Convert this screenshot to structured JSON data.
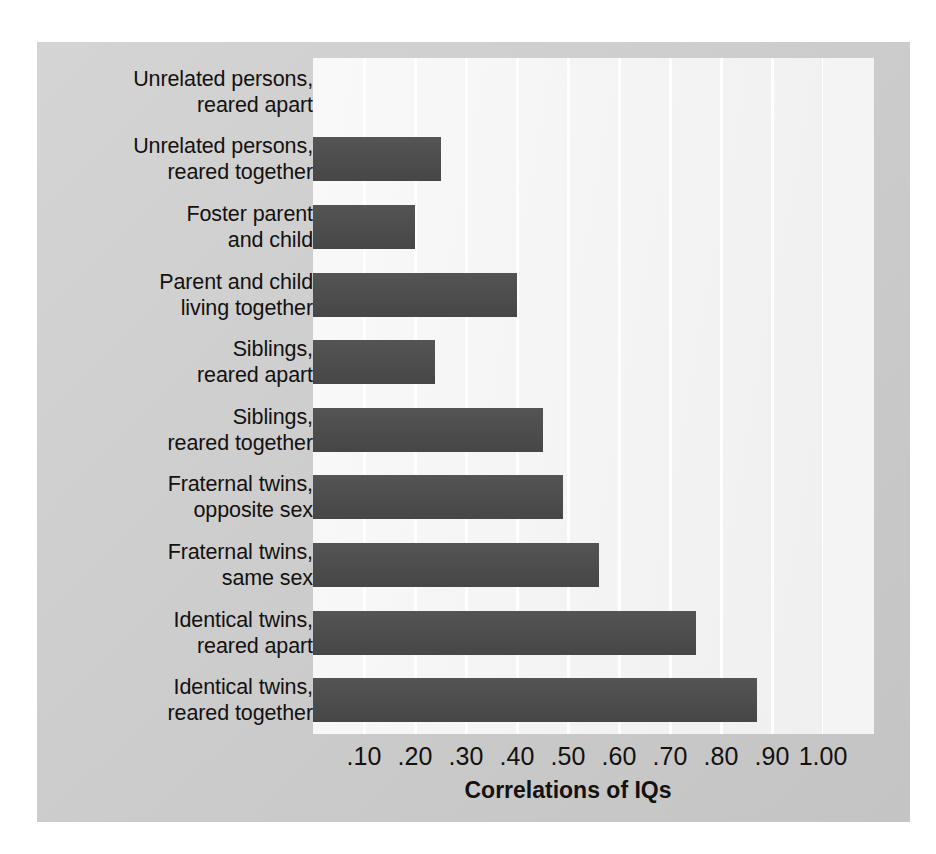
{
  "chart_data": {
    "type": "bar",
    "orientation": "horizontal",
    "title": "",
    "xlabel": "Correlations of IQs",
    "ylabel": "",
    "xlim": [
      0,
      1.0
    ],
    "xticks": [
      0.1,
      0.2,
      0.3,
      0.4,
      0.5,
      0.6,
      0.7,
      0.8,
      0.9,
      1.0
    ],
    "xtick_labels": [
      ".10",
      ".20",
      ".30",
      ".40",
      ".50",
      ".60",
      ".70",
      ".80",
      ".90",
      "1.00"
    ],
    "grid": "vertical",
    "legend": "none",
    "bar_color": "#4b4b4b",
    "plot_background": "#f2f2f2",
    "panel_background": "#cccccc",
    "categories": [
      "Unrelated persons, reared apart",
      "Unrelated persons, reared together",
      "Foster parent and child",
      "Parent and child living together",
      "Siblings, reared apart",
      "Siblings, reared together",
      "Fraternal twins, opposite sex",
      "Fraternal twins, same sex",
      "Identical twins, reared apart",
      "Identical twins, reared together"
    ],
    "category_lines": [
      [
        "Unrelated persons,",
        "reared apart"
      ],
      [
        "Unrelated persons,",
        "reared together"
      ],
      [
        "Foster parent",
        "and child"
      ],
      [
        "Parent and child",
        "living together"
      ],
      [
        "Siblings,",
        "reared apart"
      ],
      [
        "Siblings,",
        "reared together"
      ],
      [
        "Fraternal twins,",
        "opposite sex"
      ],
      [
        "Fraternal twins,",
        "same sex"
      ],
      [
        "Identical twins,",
        "reared apart"
      ],
      [
        "Identical twins,",
        "reared together"
      ]
    ],
    "values": [
      0.0,
      0.25,
      0.2,
      0.4,
      0.24,
      0.45,
      0.49,
      0.56,
      0.75,
      0.87
    ]
  }
}
